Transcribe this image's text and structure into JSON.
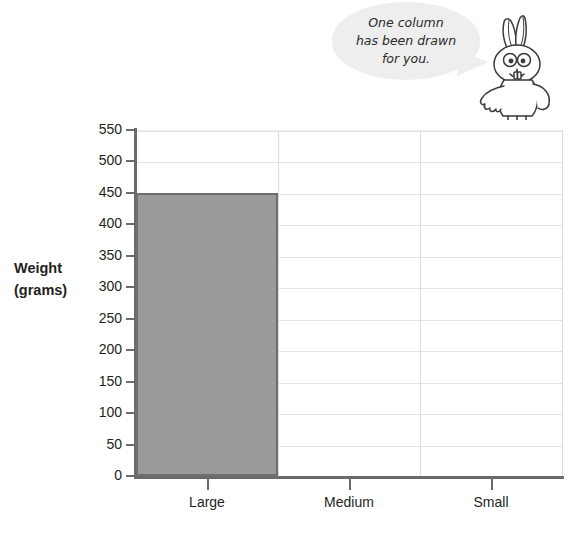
{
  "callout": {
    "text": "One column has been drawn for you.",
    "line1": "One column",
    "line2": "has been drawn",
    "line3": "for you."
  },
  "mascot": {
    "name": "rabbit-character"
  },
  "chart_data": {
    "type": "bar",
    "title": "",
    "xlabel": "",
    "ylabel": "Weight (grams)",
    "ylabel_line1": "Weight",
    "ylabel_line2": "(grams)",
    "categories": [
      "Large",
      "Medium",
      "Small"
    ],
    "values": [
      450,
      null,
      null
    ],
    "series": [
      {
        "name": "Weight",
        "values": [
          450,
          null,
          null
        ]
      }
    ],
    "ylim": [
      0,
      550
    ],
    "ytick_step": 50,
    "yticks": [
      0,
      50,
      100,
      150,
      200,
      250,
      300,
      350,
      400,
      450,
      500,
      550
    ],
    "ytick_labels": [
      "0",
      "50",
      "100",
      "150",
      "200",
      "250",
      "300",
      "350",
      "400",
      "450",
      "500",
      "550"
    ],
    "grid": true,
    "legend": false,
    "bar_fill": "#9a9a9a",
    "bar_stroke": "#6e6e6e",
    "axis_color": "#6b6b6b",
    "grid_color": "#e3e3e3"
  }
}
